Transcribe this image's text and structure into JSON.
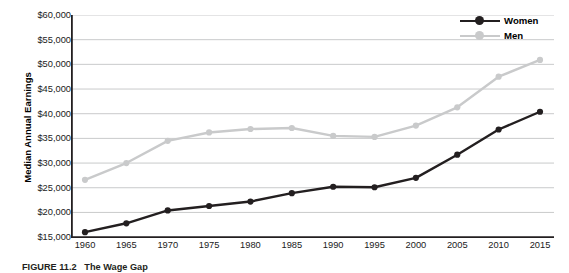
{
  "figure": {
    "caption_number": "FIGURE 11.2",
    "caption_title": "The Wage Gap",
    "caption_rest": ""
  },
  "legend": {
    "position": "top-right",
    "entries": [
      {
        "label": "Women",
        "color": "#231f20",
        "marker": "circle"
      },
      {
        "label": "Men",
        "color": "#c9cacb",
        "marker": "circle"
      }
    ]
  },
  "axis": {
    "ylabel": "Median Annual Earnings",
    "xlabel": "",
    "yticks": [
      "$15,000",
      "$20,000",
      "$25,000",
      "$30,000",
      "$35,000",
      "$40,000",
      "$45,000",
      "$50,000",
      "$55,000",
      "$60,000"
    ],
    "xticks": [
      "1960",
      "1965",
      "1970",
      "1975",
      "1980",
      "1985",
      "1990",
      "1995",
      "2000",
      "2005",
      "2010",
      "2015"
    ]
  },
  "chart_data": {
    "type": "line",
    "title": "The Wage Gap",
    "xlabel": "",
    "ylabel": "Median Annual Earnings",
    "x": [
      1960,
      1965,
      1970,
      1975,
      1980,
      1985,
      1990,
      1995,
      2000,
      2005,
      2010,
      2015
    ],
    "categories": [
      "1960",
      "1965",
      "1970",
      "1975",
      "1980",
      "1985",
      "1990",
      "1995",
      "2000",
      "2005",
      "2010",
      "2015"
    ],
    "series": [
      {
        "name": "Women",
        "color": "#231f20",
        "values": [
          16000,
          17800,
          20400,
          21300,
          22200,
          23900,
          25200,
          25100,
          27000,
          31700,
          36800,
          40400
        ]
      },
      {
        "name": "Men",
        "color": "#c9cacb",
        "values": [
          26600,
          30000,
          34500,
          36200,
          36900,
          37100,
          35500,
          35300,
          37600,
          41300,
          47500,
          50900
        ]
      }
    ],
    "ylim": [
      15000,
      60000
    ],
    "ytick_step": 5000,
    "xlim": [
      1960,
      2015
    ],
    "grid": "horizontal",
    "legend_position": "top-right",
    "currency": "USD"
  }
}
